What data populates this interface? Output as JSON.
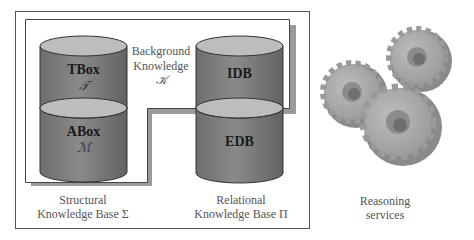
{
  "diagram": {
    "background_knowledge": {
      "line1": "Background",
      "line2": "Knowledge",
      "symbol": "𝒦"
    },
    "structural_kb": {
      "tbox": {
        "label": "TBox",
        "symbol": "𝒯"
      },
      "abox": {
        "label": "ABox",
        "symbol": "ℳ"
      },
      "caption_line1": "Structural",
      "caption_line2": "Knowledge Base Σ"
    },
    "relational_kb": {
      "idb": {
        "label": "IDB"
      },
      "edb": {
        "label": "EDB"
      },
      "caption_line1": "Relational",
      "caption_line2": "Knowledge Base Π"
    },
    "reasoning": {
      "icon": "gears-icon",
      "caption_line1": "Reasoning",
      "caption_line2": "services"
    },
    "colors": {
      "cylinder_body": "#7a7a7a",
      "cylinder_top": "#b8b8b8",
      "box_shadow": "#9a9a9a",
      "gear": "#a8a8a8",
      "border": "#555555"
    }
  }
}
